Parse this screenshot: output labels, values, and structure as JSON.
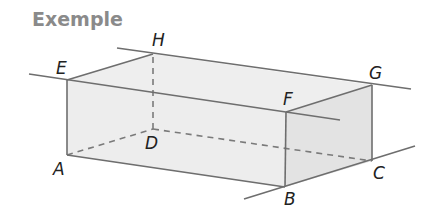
{
  "title": "Exemple",
  "colors": {
    "edge": "#6e6e6e",
    "hidden_edge": "#7a7a7a",
    "face_top": "#eeeeee",
    "face_front": "#ececec",
    "face_right": "#e2e2e2",
    "title": "#8a8a8a",
    "label": "#222222"
  },
  "vertices": {
    "A": {
      "label": "A",
      "x": 67,
      "y": 155
    },
    "B": {
      "label": "B",
      "x": 285,
      "y": 187
    },
    "C": {
      "label": "C",
      "x": 372,
      "y": 161
    },
    "D": {
      "label": "D",
      "x": 153,
      "y": 129
    },
    "E": {
      "label": "E",
      "x": 67,
      "y": 80
    },
    "F": {
      "label": "F",
      "x": 286,
      "y": 112
    },
    "G": {
      "label": "G",
      "x": 372,
      "y": 85
    },
    "H": {
      "label": "H",
      "x": 153,
      "y": 54
    }
  },
  "labels": {
    "A": "A",
    "B": "B",
    "C": "C",
    "D": "D",
    "E": "E",
    "F": "F",
    "G": "G",
    "H": "H"
  },
  "extended_lines": [
    {
      "name": "line-EF",
      "through": [
        "E",
        "F"
      ]
    },
    {
      "name": "line-HG",
      "through": [
        "H",
        "G"
      ]
    },
    {
      "name": "line-BC",
      "through": [
        "B",
        "C"
      ]
    }
  ],
  "hidden_edges": [
    "AD",
    "DC",
    "DH"
  ]
}
